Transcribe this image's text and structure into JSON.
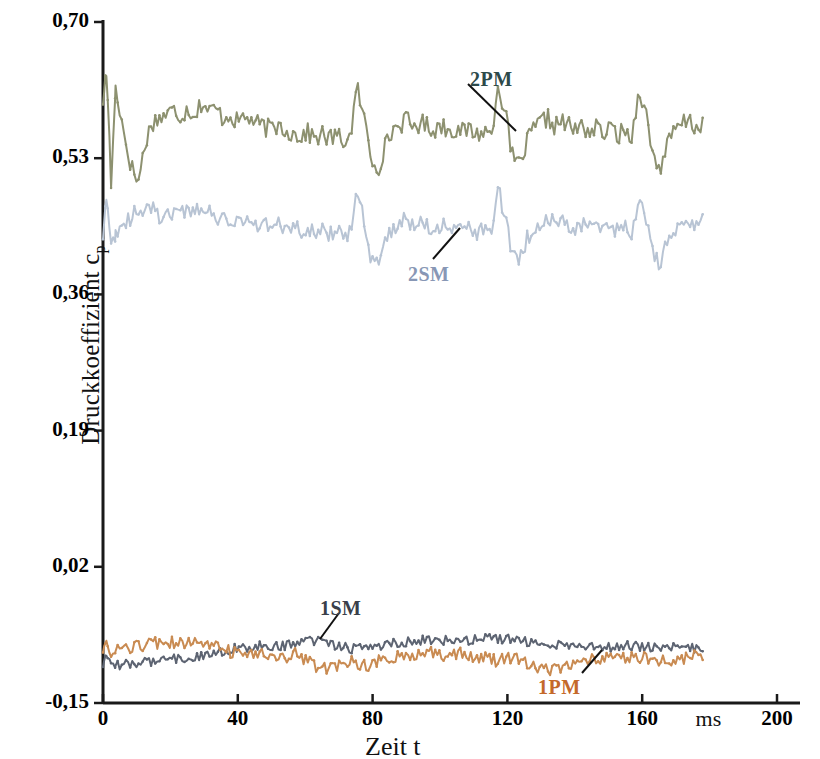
{
  "chart_data": {
    "type": "line",
    "title": "",
    "xlabel": "Zeit  t",
    "xunit": "ms",
    "ylabel": "Druckkoeffizient c",
    "ylabel_sub": "p",
    "xlim": [
      0,
      200
    ],
    "ylim": [
      -0.15,
      0.7
    ],
    "xticks": [
      0,
      40,
      80,
      120,
      160,
      200
    ],
    "xtick_labels": [
      "0",
      "40",
      "80",
      "120",
      "160",
      "200"
    ],
    "yticks": [
      -0.15,
      0.02,
      0.19,
      0.36,
      0.53,
      0.7
    ],
    "ytick_labels": [
      "-0,15",
      "0,02",
      "0,19",
      "0,36",
      "0,53",
      "0,70"
    ],
    "grid": false,
    "legend_position": "inline-annotations",
    "x_sample_start": 0,
    "x_sample_end": 178,
    "series": [
      {
        "name": "2PM",
        "color": "#8d9170",
        "label_color": "#2d4a4a",
        "baseline": 0.575,
        "noise": 0.012,
        "pulse_period": 38.5,
        "pulse_phase": 8.0,
        "pulse_up": 0.055,
        "pulse_down": -0.075,
        "startup_spike": 0.635,
        "startup_dip": 0.495,
        "values": [
          0.6,
          0.64,
          0.61,
          0.56,
          0.52,
          0.5,
          0.55,
          0.575,
          0.58,
          0.585,
          0.59,
          0.583,
          0.592,
          0.585,
          0.6,
          0.588,
          0.592,
          0.58,
          0.585,
          0.575,
          0.582,
          0.578,
          0.572,
          0.568,
          0.566,
          0.572,
          0.565,
          0.56,
          0.558,
          0.562,
          0.555,
          0.56,
          0.554,
          0.558,
          0.552,
          0.556,
          0.618,
          0.58,
          0.53,
          0.518,
          0.545,
          0.565,
          0.572,
          0.578,
          0.568,
          0.575,
          0.57,
          0.566,
          0.572,
          0.564,
          0.568,
          0.562,
          0.566,
          0.56,
          0.564,
          0.558,
          0.625,
          0.585,
          0.532,
          0.52,
          0.548,
          0.566,
          0.574,
          0.58,
          0.57,
          0.576,
          0.57,
          0.565,
          0.57,
          0.563,
          0.568,
          0.561,
          0.566,
          0.56,
          0.563,
          0.558,
          0.62,
          0.582,
          0.53,
          0.519,
          0.546,
          0.564,
          0.572,
          0.578,
          0.568,
          0.574
        ]
      },
      {
        "name": "2SM",
        "color": "#b8c4d4",
        "label_color": "#8897b5",
        "baseline": 0.455,
        "noise": 0.01,
        "pulse_period": 38.5,
        "pulse_phase": 8.0,
        "pulse_up": 0.042,
        "pulse_down": -0.058,
        "startup_spike": 0.475,
        "startup_dip": 0.425,
        "values": [
          0.43,
          0.435,
          0.44,
          0.448,
          0.455,
          0.47,
          0.462,
          0.468,
          0.458,
          0.465,
          0.46,
          0.468,
          0.462,
          0.466,
          0.458,
          0.462,
          0.455,
          0.46,
          0.452,
          0.456,
          0.45,
          0.453,
          0.447,
          0.45,
          0.444,
          0.448,
          0.442,
          0.446,
          0.44,
          0.444,
          0.438,
          0.442,
          0.436,
          0.44,
          0.434,
          0.438,
          0.49,
          0.452,
          0.405,
          0.398,
          0.425,
          0.44,
          0.448,
          0.455,
          0.447,
          0.452,
          0.446,
          0.442,
          0.448,
          0.44,
          0.445,
          0.438,
          0.443,
          0.437,
          0.441,
          0.435,
          0.492,
          0.455,
          0.408,
          0.4,
          0.428,
          0.443,
          0.45,
          0.457,
          0.448,
          0.454,
          0.448,
          0.443,
          0.449,
          0.442,
          0.447,
          0.44,
          0.445,
          0.438,
          0.443,
          0.437,
          0.49,
          0.453,
          0.406,
          0.399,
          0.426,
          0.441,
          0.449,
          0.455,
          0.447,
          0.452
        ]
      },
      {
        "name": "1SM",
        "color": "#5d6472",
        "label_color": "#3a3f4a",
        "baseline": -0.085,
        "noise": 0.006,
        "pulse_period": 38.5,
        "pulse_phase": 8.0,
        "pulse_up": 0.008,
        "pulse_down": -0.006,
        "startup_spike": -0.09,
        "startup_dip": -0.1,
        "values": [
          -0.105,
          -0.104,
          -0.103,
          -0.102,
          -0.101,
          -0.1,
          -0.099,
          -0.098,
          -0.097,
          -0.096,
          -0.095,
          -0.094,
          -0.093,
          -0.092,
          -0.09,
          -0.088,
          -0.086,
          -0.085,
          -0.083,
          -0.082,
          -0.081,
          -0.08,
          -0.079,
          -0.078,
          -0.079,
          -0.08,
          -0.078,
          -0.076,
          -0.075,
          -0.074,
          -0.073,
          -0.074,
          -0.076,
          -0.078,
          -0.08,
          -0.082,
          -0.081,
          -0.08,
          -0.079,
          -0.078,
          -0.077,
          -0.076,
          -0.075,
          -0.074,
          -0.073,
          -0.072,
          -0.071,
          -0.07,
          -0.071,
          -0.072,
          -0.073,
          -0.072,
          -0.071,
          -0.07,
          -0.069,
          -0.068,
          -0.069,
          -0.07,
          -0.071,
          -0.072,
          -0.073,
          -0.074,
          -0.075,
          -0.076,
          -0.077,
          -0.078,
          -0.077,
          -0.076,
          -0.077,
          -0.078,
          -0.079,
          -0.08,
          -0.081,
          -0.08,
          -0.079,
          -0.078,
          -0.079,
          -0.08,
          -0.081,
          -0.082,
          -0.081,
          -0.08,
          -0.081,
          -0.082,
          -0.081,
          -0.08
        ]
      },
      {
        "name": "1PM",
        "color": "#c98b52",
        "label_color": "#c4692a",
        "baseline": -0.095,
        "noise": 0.008,
        "pulse_period": 38.5,
        "pulse_phase": 8.0,
        "pulse_up": 0.01,
        "pulse_down": -0.018,
        "startup_spike": -0.075,
        "startup_dip": -0.092,
        "values": [
          -0.088,
          -0.085,
          -0.083,
          -0.08,
          -0.082,
          -0.079,
          -0.077,
          -0.076,
          -0.075,
          -0.076,
          -0.075,
          -0.074,
          -0.075,
          -0.076,
          -0.077,
          -0.079,
          -0.081,
          -0.083,
          -0.086,
          -0.088,
          -0.09,
          -0.089,
          -0.088,
          -0.09,
          -0.093,
          -0.096,
          -0.094,
          -0.088,
          -0.092,
          -0.098,
          -0.104,
          -0.107,
          -0.106,
          -0.103,
          -0.1,
          -0.098,
          -0.101,
          -0.104,
          -0.101,
          -0.098,
          -0.096,
          -0.094,
          -0.092,
          -0.09,
          -0.089,
          -0.088,
          -0.087,
          -0.089,
          -0.091,
          -0.09,
          -0.089,
          -0.088,
          -0.09,
          -0.092,
          -0.094,
          -0.096,
          -0.098,
          -0.096,
          -0.094,
          -0.096,
          -0.099,
          -0.102,
          -0.106,
          -0.11,
          -0.107,
          -0.104,
          -0.101,
          -0.099,
          -0.097,
          -0.095,
          -0.094,
          -0.093,
          -0.092,
          -0.094,
          -0.096,
          -0.094,
          -0.092,
          -0.093,
          -0.095,
          -0.097,
          -0.096,
          -0.095,
          -0.094,
          -0.093,
          -0.092,
          -0.091
        ]
      }
    ],
    "annotations": [
      {
        "name": "2PM",
        "label_x": 470,
        "label_y": 68,
        "leader": [
          [
            468,
            84
          ],
          [
            516,
            131
          ]
        ]
      },
      {
        "name": "2SM",
        "label_x": 408,
        "label_y": 263,
        "leader": [
          [
            433,
            259
          ],
          [
            460,
            228
          ]
        ]
      },
      {
        "name": "1SM",
        "label_x": 320,
        "label_y": 597,
        "leader": [
          [
            339,
            613
          ],
          [
            320,
            639
          ]
        ]
      },
      {
        "name": "1PM",
        "label_x": 538,
        "label_y": 676,
        "leader": [
          [
            582,
            673
          ],
          [
            602,
            650
          ]
        ]
      }
    ]
  },
  "axis": {
    "x_unit_label": "ms"
  }
}
